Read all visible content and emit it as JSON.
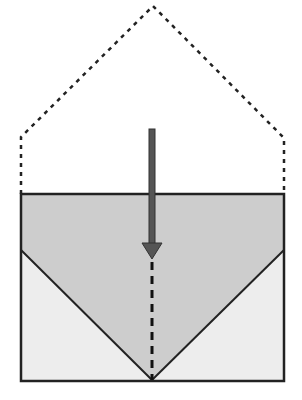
{
  "diagram": {
    "colors": {
      "background": "#ffffff",
      "upper_fill": "#cdcdcd",
      "lower_fill": "#ededed",
      "stroke": "#222222",
      "arrow": "#555555",
      "dashed_outline": "#222222"
    },
    "outline": {
      "apex": [
        153,
        6
      ],
      "left_corner": [
        21,
        137
      ],
      "right_corner": [
        284,
        138
      ],
      "left_base": [
        21,
        194
      ],
      "right_base": [
        284,
        194
      ]
    },
    "box": {
      "x": 21,
      "y": 194,
      "width": 263,
      "height": 187
    },
    "v_shape": {
      "left_start": [
        21,
        250
      ],
      "vertex": [
        152,
        380
      ],
      "right_start": [
        284,
        250
      ]
    },
    "arrow": {
      "x": 152,
      "shaft_top": 129,
      "head_base": 243,
      "tip": 258,
      "head_half_width": 10
    },
    "axis_dashed": {
      "x": 152,
      "y_start": 260,
      "y_end": 380
    }
  }
}
